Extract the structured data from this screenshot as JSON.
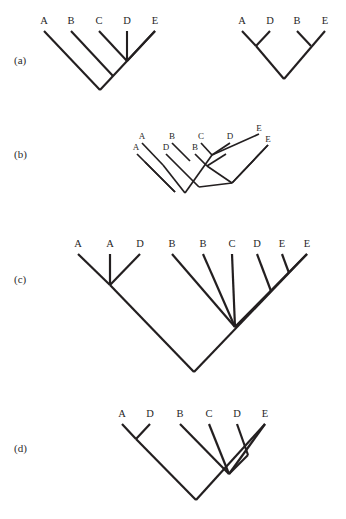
{
  "figure": {
    "background_color": "#ffffff",
    "line_color": "#231f20",
    "text_color": "#1f1f1f",
    "width": 346,
    "height": 519
  },
  "panels": [
    {
      "id": "a",
      "label": "(a)",
      "label_x": 14,
      "label_y": 64,
      "trees": [
        {
          "id": "a-left",
          "name": "tree-a-left",
          "stroke_width": 2.1,
          "labels": [
            {
              "text": "A",
              "x": 44,
              "y": 24
            },
            {
              "text": "B",
              "x": 71,
              "y": 24
            },
            {
              "text": "C",
              "x": 99,
              "y": 24
            },
            {
              "text": "D",
              "x": 127,
              "y": 24
            },
            {
              "text": "E",
              "x": 155,
              "y": 24
            }
          ],
          "segments": [
            [
              44,
              31,
              100,
              90
            ],
            [
              71,
              31,
              113,
              76
            ],
            [
              99,
              31,
              127,
              61
            ],
            [
              127,
              31,
              127,
              61
            ],
            [
              155,
              31,
              127,
              61
            ],
            [
              100,
              90,
              155,
              31
            ]
          ]
        },
        {
          "id": "a-right",
          "name": "tree-a-right",
          "stroke_width": 2.1,
          "labels": [
            {
              "text": "A",
              "x": 242,
              "y": 24
            },
            {
              "text": "D",
              "x": 270,
              "y": 24
            },
            {
              "text": "B",
              "x": 297,
              "y": 24
            },
            {
              "text": "E",
              "x": 325,
              "y": 24
            }
          ],
          "segments": [
            [
              242,
              31,
              256,
              46
            ],
            [
              270,
              31,
              256,
              46
            ],
            [
              256,
              46,
              284,
              79
            ],
            [
              297,
              31,
              311,
              46
            ],
            [
              325,
              31,
              284,
              79
            ],
            [
              311,
              46,
              311,
              46
            ]
          ]
        }
      ]
    },
    {
      "id": "b",
      "label": "(b)",
      "label_x": 14,
      "label_y": 158,
      "trees": [
        {
          "id": "b-upper",
          "name": "tree-b-upper",
          "stroke_width": 1.7,
          "labels": [
            {
              "text": "A",
              "x": 142,
              "y": 139,
              "small": true
            },
            {
              "text": "B",
              "x": 172,
              "y": 139,
              "small": true
            },
            {
              "text": "C",
              "x": 201,
              "y": 139,
              "small": true
            },
            {
              "text": "D",
              "x": 230,
              "y": 139,
              "small": true
            },
            {
              "text": "E",
              "x": 259,
              "y": 131,
              "small": true
            }
          ],
          "segments": [
            [
              142,
              143,
              163,
              165
            ],
            [
              172,
              143,
              190,
              161
            ],
            [
              201,
              143,
              212,
              155
            ],
            [
              230,
              143,
              212,
              155
            ],
            [
              259,
              134,
              212,
              155
            ],
            [
              163,
              165,
              185,
              193
            ],
            [
              185,
              193,
              212,
              155
            ],
            [
              190,
              161,
              190,
              161
            ]
          ]
        },
        {
          "id": "b-lower",
          "name": "tree-b-lower",
          "stroke_width": 1.7,
          "labels": [
            {
              "text": "A",
              "x": 136,
              "y": 150,
              "small": true
            },
            {
              "text": "D",
              "x": 166,
              "y": 150,
              "small": true
            },
            {
              "text": "B",
              "x": 195,
              "y": 150,
              "small": true
            },
            {
              "text": "E",
              "x": 268,
              "y": 142,
              "small": true
            }
          ],
          "segments": [
            [
              137,
              154,
              175,
              192
            ],
            [
              166,
              154,
              199,
              187
            ],
            [
              195,
              154,
              207,
              166
            ],
            [
              226,
              154,
              207,
              166
            ],
            [
              268,
              145,
              232,
              183
            ],
            [
              175,
              192,
              160,
              177
            ],
            [
              160,
              177,
              145,
              162
            ],
            [
              207,
              166,
              232,
              183
            ],
            [
              199,
              187,
              232,
              183
            ],
            [
              232,
              183,
              268,
              145
            ]
          ]
        }
      ]
    },
    {
      "id": "c",
      "label": "(c)",
      "label_x": 14,
      "label_y": 283,
      "trees": [
        {
          "id": "c-main",
          "name": "tree-c-main",
          "stroke_width": 2.2,
          "labels": [
            {
              "text": "A",
              "x": 78,
              "y": 247
            },
            {
              "text": "A",
              "x": 110,
              "y": 247
            },
            {
              "text": "D",
              "x": 140,
              "y": 247
            },
            {
              "text": "B",
              "x": 172,
              "y": 247
            },
            {
              "text": "B",
              "x": 203,
              "y": 247
            },
            {
              "text": "C",
              "x": 232,
              "y": 247
            },
            {
              "text": "D",
              "x": 257,
              "y": 247
            },
            {
              "text": "E",
              "x": 282,
              "y": 247
            },
            {
              "text": "E",
              "x": 307,
              "y": 247
            }
          ],
          "segments": [
            [
              78,
              254,
              110,
              285
            ],
            [
              110,
              254,
              110,
              285
            ],
            [
              140,
              254,
              110,
              285
            ],
            [
              110,
              285,
              194,
              372
            ],
            [
              172,
              254,
              235,
              327
            ],
            [
              203,
              254,
              235,
              327
            ],
            [
              232,
              254,
              235,
              327
            ],
            [
              257,
              254,
              271,
              291
            ],
            [
              282,
              254,
              289,
              273
            ],
            [
              307,
              254,
              235,
              327
            ],
            [
              271,
              291,
              235,
              327
            ],
            [
              194,
              372,
              307,
              254
            ]
          ]
        }
      ]
    },
    {
      "id": "d",
      "label": "(d)",
      "label_x": 14,
      "label_y": 452,
      "trees": [
        {
          "id": "d-main",
          "name": "tree-d-main",
          "stroke_width": 2.2,
          "labels": [
            {
              "text": "A",
              "x": 122,
              "y": 417
            },
            {
              "text": "D",
              "x": 150,
              "y": 417
            },
            {
              "text": "B",
              "x": 180,
              "y": 417
            },
            {
              "text": "C",
              "x": 209,
              "y": 417
            },
            {
              "text": "D",
              "x": 237,
              "y": 417
            },
            {
              "text": "E",
              "x": 265,
              "y": 417
            }
          ],
          "segments": [
            [
              122,
              424,
              136,
              439
            ],
            [
              150,
              424,
              136,
              439
            ],
            [
              136,
              439,
              196,
              500
            ],
            [
              180,
              424,
              229,
              474
            ],
            [
              209,
              424,
              229,
              474
            ],
            [
              237,
              424,
              248,
              455
            ],
            [
              265,
              424,
              229,
              474
            ],
            [
              248,
              455,
              229,
              474
            ],
            [
              196,
              500,
              265,
              424
            ]
          ]
        }
      ]
    }
  ],
  "chart_data": {
    "type": "diagram",
    "subtype": "cladogram",
    "taxa": [
      "A",
      "B",
      "C",
      "D",
      "E"
    ],
    "panels": [
      {
        "panel": "(a)",
        "trees": [
          {
            "leaves": [
              "A",
              "B",
              "C",
              "D",
              "E"
            ],
            "newick": "(A,(B,(C,D,E)));"
          },
          {
            "leaves": [
              "A",
              "D",
              "B",
              "E"
            ],
            "newick": "((A,D),(B,E));"
          }
        ]
      },
      {
        "panel": "(b)",
        "note": "two superimposed small cladograms",
        "trees": [
          {
            "leaves": [
              "A",
              "B",
              "C",
              "D",
              "E"
            ],
            "newick": "((A,B),(C,D,E));"
          },
          {
            "leaves": [
              "A",
              "D",
              "B",
              "E"
            ],
            "newick": "((A,D),(B,E));"
          }
        ]
      },
      {
        "panel": "(c)",
        "trees": [
          {
            "leaves": [
              "A",
              "A",
              "D",
              "B",
              "B",
              "C",
              "D",
              "E",
              "E"
            ],
            "newick": "((A,A,D),(B,B,C,(D,(E,E))));"
          }
        ]
      },
      {
        "panel": "(d)",
        "trees": [
          {
            "leaves": [
              "A",
              "D",
              "B",
              "C",
              "D",
              "E"
            ],
            "newick": "((A,D),(B,C,(D,E)));"
          }
        ]
      }
    ]
  }
}
